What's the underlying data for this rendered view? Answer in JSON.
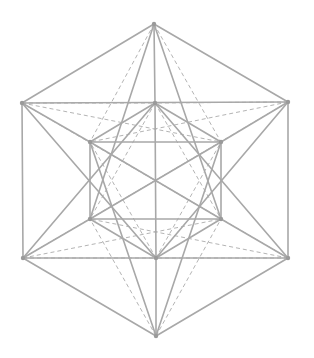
{
  "diagram": {
    "title": "",
    "colors": {
      "solid_edge": "#a8a8a8",
      "dashed_edge": "#b4b4b4",
      "vertex": "#9a9a9a",
      "background": "#ffffff"
    },
    "vertices": {
      "T": [
        154,
        24
      ],
      "UL": [
        22,
        103
      ],
      "UR": [
        288,
        102
      ],
      "LL": [
        23,
        258
      ],
      "LR": [
        288,
        258
      ],
      "B": [
        156,
        336
      ],
      "IT": [
        155,
        103
      ],
      "IL": [
        90,
        142
      ],
      "IR": [
        221,
        142
      ],
      "ILL": [
        90,
        219
      ],
      "ILR": [
        221,
        219
      ],
      "IB": [
        156,
        258
      ]
    },
    "solid_edges": [
      [
        "T",
        "UL"
      ],
      [
        "T",
        "UR"
      ],
      [
        "UL",
        "LL"
      ],
      [
        "UR",
        "LR"
      ],
      [
        "LL",
        "B"
      ],
      [
        "LR",
        "B"
      ],
      [
        "UL",
        "UR"
      ],
      [
        "LL",
        "LR"
      ],
      [
        "T",
        "IT"
      ],
      [
        "IT",
        "IB"
      ],
      [
        "IB",
        "B"
      ],
      [
        "T",
        "ILL"
      ],
      [
        "T",
        "ILR"
      ],
      [
        "B",
        "IL"
      ],
      [
        "B",
        "IR"
      ],
      [
        "UL",
        "IL"
      ],
      [
        "UR",
        "IR"
      ],
      [
        "LL",
        "ILL"
      ],
      [
        "LR",
        "ILR"
      ],
      [
        "IL",
        "IR"
      ],
      [
        "ILL",
        "ILR"
      ],
      [
        "IT",
        "IL"
      ],
      [
        "IT",
        "IR"
      ],
      [
        "IB",
        "ILL"
      ],
      [
        "IB",
        "ILR"
      ],
      [
        "IL",
        "ILL"
      ],
      [
        "IR",
        "ILR"
      ],
      [
        "IL",
        "ILR"
      ],
      [
        "IR",
        "ILL"
      ],
      [
        "UL",
        "IB"
      ],
      [
        "UR",
        "IB"
      ],
      [
        "LL",
        "IT"
      ],
      [
        "LR",
        "IT"
      ]
    ],
    "dashed_edges": [
      [
        "UL",
        "IR"
      ],
      [
        "UR",
        "IL"
      ],
      [
        "LL",
        "ILR"
      ],
      [
        "LR",
        "ILL"
      ],
      [
        "UL",
        "ILR"
      ],
      [
        "UR",
        "ILL"
      ],
      [
        "LL",
        "IR"
      ],
      [
        "LR",
        "IL"
      ],
      [
        "T",
        "IL"
      ],
      [
        "T",
        "IR"
      ],
      [
        "B",
        "ILL"
      ],
      [
        "B",
        "ILR"
      ],
      [
        "IT",
        "ILL"
      ],
      [
        "IT",
        "ILR"
      ],
      [
        "IB",
        "IL"
      ],
      [
        "IB",
        "IR"
      ],
      [
        "UL",
        "IT"
      ],
      [
        "UR",
        "IT"
      ],
      [
        "LL",
        "IB"
      ],
      [
        "LR",
        "IB"
      ]
    ]
  }
}
